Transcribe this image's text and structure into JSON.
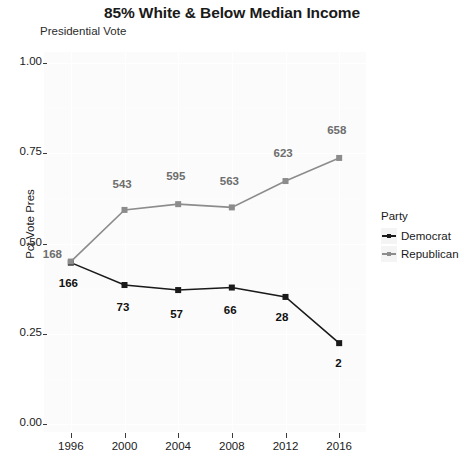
{
  "header": {
    "title": "85% White & Below Median Income",
    "subtitle": "Presidential Vote"
  },
  "axes": {
    "ylabel": "Pct Vote Pres",
    "xlabel": "",
    "y_ticks": [
      "0.00",
      "0.25",
      "0.50",
      "0.75",
      "1.00"
    ],
    "x_ticks": [
      "1996",
      "2000",
      "2004",
      "2008",
      "2012",
      "2016"
    ]
  },
  "legend": {
    "title": "Party",
    "position": "right",
    "entries": [
      {
        "label": "Democrat",
        "color": "#1a1a1a"
      },
      {
        "label": "Republican",
        "color": "#8c8c8c"
      }
    ]
  },
  "colors": {
    "democrat": "#1a1a1a",
    "republican": "#8c8c8c",
    "panel_background": "#fbfbfb",
    "grid": "#ffffff",
    "text": "#1a1a1a"
  },
  "chart_data": {
    "type": "line",
    "title": "85% White & Below Median Income",
    "subtitle": "Presidential Vote",
    "xlabel": "",
    "ylabel": "Pct Vote Pres",
    "x": [
      1996,
      2000,
      2004,
      2008,
      2012,
      2016
    ],
    "xlim": [
      1994,
      2018
    ],
    "ylim": [
      0.0,
      1.0
    ],
    "grid": true,
    "legend_title": "Party",
    "series": [
      {
        "name": "Democrat",
        "color": "#1a1a1a",
        "values": [
          0.447,
          0.385,
          0.371,
          0.378,
          0.352,
          0.224
        ],
        "point_labels": [
          "166",
          "73",
          "57",
          "66",
          "28",
          "2"
        ]
      },
      {
        "name": "Republican",
        "color": "#8c8c8c",
        "values": [
          0.45,
          0.593,
          0.609,
          0.6,
          0.673,
          0.737
        ],
        "point_labels": [
          "168",
          "543",
          "595",
          "563",
          "623",
          "658"
        ]
      }
    ]
  }
}
